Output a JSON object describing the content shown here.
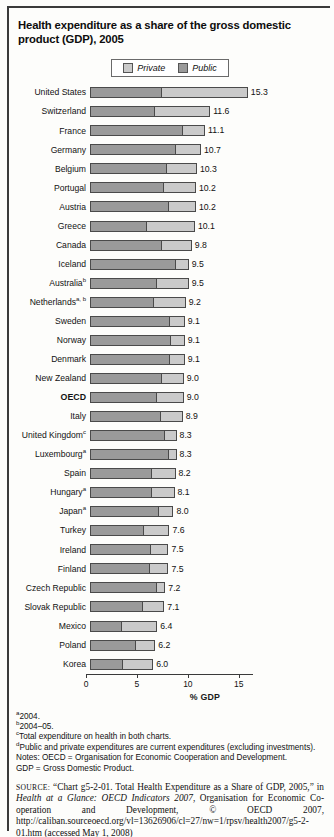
{
  "title": "Health expenditure as a share of the gross domestic product (GDP), 2005",
  "legend": {
    "private_label": "Private",
    "public_label": "Public",
    "private_color": "#cacaca",
    "public_color": "#9a9a9a"
  },
  "chart_data": {
    "type": "bar",
    "orientation": "horizontal",
    "stacked": true,
    "title": "Health expenditure as a share of the gross domestic product (GDP), 2005",
    "xlabel": "% GDP",
    "ylabel": "",
    "xlim": [
      0,
      16
    ],
    "ticks": [
      0,
      5,
      10,
      15
    ],
    "grid": false,
    "legend_position": "top-center",
    "categories": [
      "United States",
      "Switzerland",
      "France",
      "Germany",
      "Belgium",
      "Portugal",
      "Austria",
      "Greece",
      "Canada",
      "Iceland",
      "Australia",
      "Netherlands",
      "Sweden",
      "Norway",
      "Denmark",
      "New Zealand",
      "OECD",
      "Italy",
      "United Kingdom",
      "Luxembourg",
      "Spain",
      "Hungary",
      "Japan",
      "Turkey",
      "Ireland",
      "Finland",
      "Czech Republic",
      "Slovak Republic",
      "Mexico",
      "Poland",
      "Korea"
    ],
    "series": [
      {
        "name": "Public",
        "values": [
          6.9,
          6.2,
          8.9,
          8.2,
          7.4,
          7.1,
          7.6,
          5.4,
          6.9,
          8.2,
          6.4,
          6.1,
          7.7,
          7.8,
          7.7,
          6.9,
          6.4,
          6.8,
          7.2,
          7.6,
          5.9,
          5.9,
          6.6,
          5.1,
          5.8,
          5.7,
          6.4,
          5.0,
          2.9,
          4.3,
          3.0
        ]
      },
      {
        "name": "Private",
        "values": [
          8.4,
          5.4,
          2.2,
          2.5,
          2.9,
          3.1,
          2.6,
          4.7,
          2.9,
          1.3,
          3.1,
          3.1,
          1.4,
          1.3,
          1.4,
          2.1,
          2.6,
          2.1,
          1.1,
          0.7,
          2.3,
          2.2,
          1.4,
          2.5,
          1.7,
          1.8,
          0.8,
          2.1,
          3.5,
          1.9,
          3.0
        ]
      }
    ],
    "totals": [
      15.3,
      11.6,
      11.1,
      10.7,
      10.3,
      10.2,
      10.2,
      10.1,
      9.8,
      9.5,
      9.5,
      9.2,
      9.1,
      9.1,
      9.1,
      9.0,
      9.0,
      8.9,
      8.3,
      8.3,
      8.2,
      8.1,
      8.0,
      7.6,
      7.5,
      7.5,
      7.2,
      7.1,
      6.4,
      6.2,
      6.0
    ]
  },
  "rows": [
    {
      "label": "United States",
      "sup": "",
      "bold": false,
      "public": 6.9,
      "private": 8.4,
      "total": "15.3"
    },
    {
      "label": "Switzerland",
      "sup": "",
      "bold": false,
      "public": 6.2,
      "private": 5.4,
      "total": "11.6"
    },
    {
      "label": "France",
      "sup": "",
      "bold": false,
      "public": 8.9,
      "private": 2.2,
      "total": "11.1"
    },
    {
      "label": "Germany",
      "sup": "",
      "bold": false,
      "public": 8.2,
      "private": 2.5,
      "total": "10.7"
    },
    {
      "label": "Belgium",
      "sup": "",
      "bold": false,
      "public": 7.4,
      "private": 2.9,
      "total": "10.3"
    },
    {
      "label": "Portugal",
      "sup": "",
      "bold": false,
      "public": 7.1,
      "private": 3.1,
      "total": "10.2"
    },
    {
      "label": "Austria",
      "sup": "",
      "bold": false,
      "public": 7.6,
      "private": 2.6,
      "total": "10.2"
    },
    {
      "label": "Greece",
      "sup": "",
      "bold": false,
      "public": 5.4,
      "private": 4.7,
      "total": "10.1"
    },
    {
      "label": "Canada",
      "sup": "",
      "bold": false,
      "public": 6.9,
      "private": 2.9,
      "total": "9.8"
    },
    {
      "label": "Iceland",
      "sup": "",
      "bold": false,
      "public": 8.2,
      "private": 1.3,
      "total": "9.5"
    },
    {
      "label": "Australia",
      "sup": "b",
      "bold": false,
      "public": 6.4,
      "private": 3.1,
      "total": "9.5"
    },
    {
      "label": "Netherlands",
      "sup": "a, b",
      "bold": false,
      "public": 6.1,
      "private": 3.1,
      "total": "9.2"
    },
    {
      "label": "Sweden",
      "sup": "",
      "bold": false,
      "public": 7.7,
      "private": 1.4,
      "total": "9.1"
    },
    {
      "label": "Norway",
      "sup": "",
      "bold": false,
      "public": 7.8,
      "private": 1.3,
      "total": "9.1"
    },
    {
      "label": "Denmark",
      "sup": "",
      "bold": false,
      "public": 7.7,
      "private": 1.4,
      "total": "9.1"
    },
    {
      "label": "New Zealand",
      "sup": "",
      "bold": false,
      "public": 6.9,
      "private": 2.1,
      "total": "9.0"
    },
    {
      "label": "OECD",
      "sup": "",
      "bold": true,
      "public": 6.4,
      "private": 2.6,
      "total": "9.0"
    },
    {
      "label": "Italy",
      "sup": "",
      "bold": false,
      "public": 6.8,
      "private": 2.1,
      "total": "8.9"
    },
    {
      "label": "United Kingdom",
      "sup": "c",
      "bold": false,
      "public": 7.2,
      "private": 1.1,
      "total": "8.3"
    },
    {
      "label": "Luxembourg",
      "sup": "a",
      "bold": false,
      "public": 7.6,
      "private": 0.7,
      "total": "8.3"
    },
    {
      "label": "Spain",
      "sup": "",
      "bold": false,
      "public": 5.9,
      "private": 2.3,
      "total": "8.2"
    },
    {
      "label": "Hungary",
      "sup": "a",
      "bold": false,
      "public": 5.9,
      "private": 2.2,
      "total": "8.1"
    },
    {
      "label": "Japan",
      "sup": "a",
      "bold": false,
      "public": 6.6,
      "private": 1.4,
      "total": "8.0"
    },
    {
      "label": "Turkey",
      "sup": "",
      "bold": false,
      "public": 5.1,
      "private": 2.5,
      "total": "7.6"
    },
    {
      "label": "Ireland",
      "sup": "",
      "bold": false,
      "public": 5.8,
      "private": 1.7,
      "total": "7.5"
    },
    {
      "label": "Finland",
      "sup": "",
      "bold": false,
      "public": 5.7,
      "private": 1.8,
      "total": "7.5"
    },
    {
      "label": "Czech Republic",
      "sup": "",
      "bold": false,
      "public": 6.4,
      "private": 0.8,
      "total": "7.2"
    },
    {
      "label": "Slovak Republic",
      "sup": "",
      "bold": false,
      "public": 5.0,
      "private": 2.1,
      "total": "7.1"
    },
    {
      "label": "Mexico",
      "sup": "",
      "bold": false,
      "public": 2.9,
      "private": 3.5,
      "total": "6.4"
    },
    {
      "label": "Poland",
      "sup": "",
      "bold": false,
      "public": 4.3,
      "private": 1.9,
      "total": "6.2"
    },
    {
      "label": "Korea",
      "sup": "",
      "bold": false,
      "public": 3.0,
      "private": 3.0,
      "total": "6.0"
    }
  ],
  "axis": {
    "ticks": [
      "0",
      "5",
      "10",
      "15"
    ],
    "tick_values": [
      0,
      5,
      10,
      15
    ],
    "axis_title": "% GDP",
    "max": 16
  },
  "footnotes": {
    "a_sup": "a",
    "a_text": "2004.",
    "b_sup": "b",
    "b_text": "2004–05.",
    "c_sup": "c",
    "c_text": "Total expenditure on health in both charts.",
    "d_sup": "d",
    "d_text": "Public and private expenditures are current expenditures (excluding investments).",
    "notes_line1": "Notes: OECD = Organisation for Economic Cooperation and Development.",
    "notes_line2": "GDP = Gross Domestic Product."
  },
  "source": {
    "label": "SOURCE:",
    "part1": " “Chart g5-2-01. Total Health Expenditure as a Share of GDP, 2005,” in ",
    "italic": "Health at a Glance: OECD Indicators 2007",
    "part2": ", Organisation for Economic Co-operation and Development, © OECD 2007, http://caliban.sourceoecd.org/vl=13626906/cl=27/nw=1/rpsv/health2007/g5-2-01.htm (accessed May 1, 2008)"
  }
}
